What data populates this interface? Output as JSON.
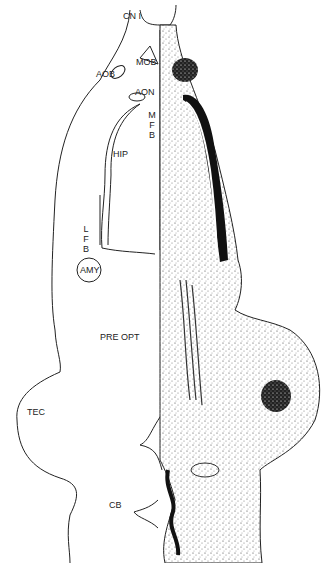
{
  "figure": {
    "type": "brain-section-diagram",
    "colors": {
      "outline": "#222222",
      "stain": "#111111",
      "background": "#ffffff"
    },
    "labels": {
      "cn1": "CN I",
      "mob": "MOB",
      "aob": "AOB",
      "aon": "AON",
      "mfb": [
        "M",
        "F",
        "B"
      ],
      "hip": "HIP",
      "lfb": [
        "L",
        "F",
        "B"
      ],
      "amy": "AMY",
      "pre_opt": "PRE OPT",
      "tec": "TEC",
      "cb": "CB"
    }
  }
}
